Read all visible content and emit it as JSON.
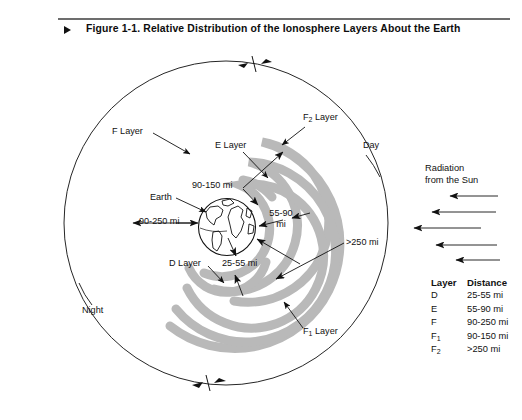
{
  "header": {
    "bullet_icon": "triangle-right-icon",
    "title": "Figure 1-1. Relative Distribution of the Ionosphere Layers About the Earth"
  },
  "diagram": {
    "title": "Relative Distribution of the Ionosphere Layers About the Earth",
    "center_object": "Earth",
    "labels": {
      "earth": "Earth",
      "f_layer": "F Layer",
      "f1_layer_main": "F",
      "f1_layer_sub": "1",
      "f1_layer_suffix": " Layer",
      "f2_layer_main": "F",
      "f2_layer_sub": "2",
      "f2_layer_suffix": " Layer",
      "e_layer": "E Layer",
      "d_layer": "D Layer",
      "day": "Day",
      "night": "Night"
    },
    "dimensions": {
      "d_layer_distance": "25-55 mi",
      "e_layer_distance_line1": "55-90",
      "e_layer_distance_line2": "mi",
      "f_layer_distance": "90-250 mi",
      "f1_layer_distance": "90-150 mi",
      "f2_layer_distance": ">250 mi"
    },
    "radiation": {
      "line1": "Radiation",
      "line2": "from the Sun",
      "arrow_count": 5
    },
    "colors": {
      "layer_band": "#b9b9b9",
      "outline": "#1a1a1a",
      "rule": "#6d6d6d",
      "background": "#ffffff"
    }
  },
  "legend": {
    "headers": [
      "Layer",
      "Distance"
    ],
    "rows": [
      {
        "layer": "D",
        "sub": "",
        "distance": "25-55 mi"
      },
      {
        "layer": "E",
        "sub": "",
        "distance": "55-90 mi"
      },
      {
        "layer": "F",
        "sub": "",
        "distance": "90-250 mi"
      },
      {
        "layer": "F",
        "sub": "1",
        "distance": "90-150 mi"
      },
      {
        "layer": "F",
        "sub": "2",
        "distance": ">250 mi"
      }
    ]
  }
}
